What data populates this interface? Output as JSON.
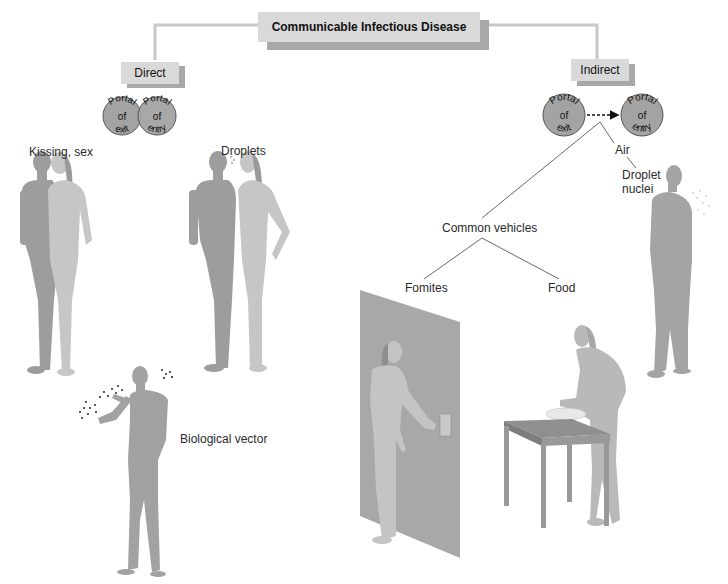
{
  "title": "Communicable Infectious Disease",
  "branches": {
    "direct": {
      "label": "Direct",
      "portals": [
        {
          "top": "Portal",
          "mid": "of",
          "bottom": "exit"
        },
        {
          "top": "Portal",
          "mid": "of",
          "bottom": "entry"
        }
      ],
      "modes": [
        {
          "label": "Kissing, sex",
          "figure": "couple-embracing"
        },
        {
          "label": "Droplets",
          "figure": "couple-talking"
        },
        {
          "label": "Biological vector",
          "figure": "person-with-insects"
        }
      ]
    },
    "indirect": {
      "label": "Indirect",
      "portals": [
        {
          "top": "Portal",
          "mid": "of",
          "bottom": "exit"
        },
        {
          "top": "Portal",
          "mid": "of",
          "bottom": "entry"
        }
      ],
      "modes": {
        "air": {
          "label": "Air",
          "child": "Droplet nuclei",
          "figure": "person-exhaling"
        },
        "common_vehicles": {
          "label": "Common vehicles",
          "children": [
            {
              "label": "Fomites",
              "figure": "person-at-door"
            },
            {
              "label": "Food",
              "figure": "person-at-table"
            }
          ]
        }
      }
    }
  },
  "colors": {
    "box": "#d9d9d9",
    "box_shadow": "#a9a9a9",
    "connector": "#c8c8c8",
    "portal_fill": "#a3a3a3",
    "figure_dark": "#9a9a9a",
    "figure_light": "#c4c4c4",
    "door": "#a8a8a8"
  }
}
